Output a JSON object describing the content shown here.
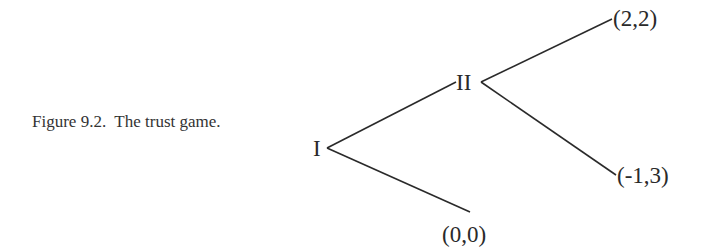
{
  "caption": {
    "text": "Figure 9.2.  The trust game."
  },
  "tree": {
    "nodes": [
      {
        "id": "I",
        "label": "I"
      },
      {
        "id": "II",
        "label": "II"
      }
    ],
    "payoffs": [
      {
        "id": "trust-honor",
        "label": "(2,2)"
      },
      {
        "id": "trust-abuse",
        "label": "(-1,3)"
      },
      {
        "id": "no-trust",
        "label": "(0,0)"
      }
    ],
    "colors": {
      "line": "#2a2a2a",
      "text": "#2a2a2a",
      "background": "#ffffff"
    }
  }
}
